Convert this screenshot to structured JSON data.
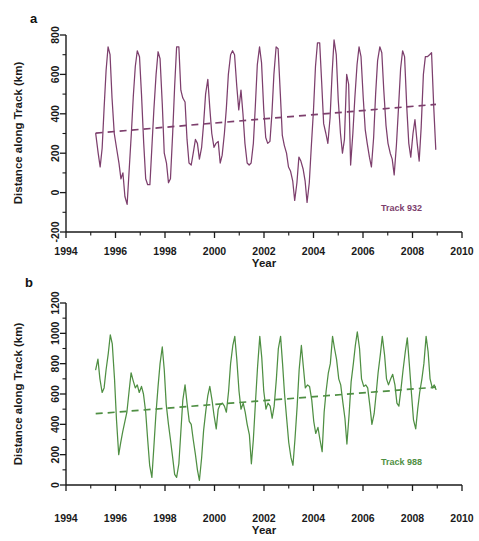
{
  "figure": {
    "background": "#ffffff",
    "panels": [
      {
        "letter": "a",
        "series_label": "Track 932",
        "color": "#7d3f6d",
        "chart_ref": 0
      },
      {
        "letter": "b",
        "series_label": "Track 988",
        "color": "#4f8f43",
        "chart_ref": 1
      }
    ]
  },
  "chart_data": [
    {
      "type": "line",
      "title": "",
      "subtitle": "",
      "xlabel": "Year",
      "ylabel": "Distance along Track (km)",
      "series_label": "Track 932",
      "color": "#7d3f6d",
      "trend_color": "#7d3f6d",
      "trend_style": "dashed",
      "grid": false,
      "legend_position": "inside-bottom-right",
      "xlim": [
        1994,
        2010
      ],
      "ylim": [
        -200,
        800
      ],
      "xticks": [
        1994,
        1996,
        1998,
        2000,
        2002,
        2004,
        2006,
        2008,
        2010
      ],
      "xticks_minor_step": 1,
      "yticks": [
        -200,
        0,
        200,
        400,
        600,
        800
      ],
      "yticks_minor_step": 100,
      "trend_line": {
        "x": [
          1995.2,
          2008.95
        ],
        "y": [
          302,
          448
        ]
      },
      "x": [
        1995.2,
        1995.3,
        1995.38,
        1995.46,
        1995.54,
        1995.62,
        1995.7,
        1995.78,
        1995.86,
        1995.95,
        1996.05,
        1996.14,
        1996.22,
        1996.3,
        1996.38,
        1996.47,
        1996.55,
        1996.64,
        1996.72,
        1996.8,
        1996.88,
        1996.97,
        1997.05,
        1997.14,
        1997.22,
        1997.3,
        1997.39,
        1997.47,
        1997.55,
        1997.64,
        1997.72,
        1997.8,
        1997.89,
        1997.97,
        1998.06,
        1998.14,
        1998.22,
        1998.31,
        1998.39,
        1998.47,
        1998.56,
        1998.64,
        1998.72,
        1998.81,
        1998.89,
        1998.97,
        1999.06,
        1999.14,
        1999.23,
        1999.31,
        1999.39,
        1999.48,
        1999.56,
        1999.64,
        1999.73,
        1999.81,
        1999.89,
        1999.98,
        2000.06,
        2000.15,
        2000.23,
        2000.31,
        2000.4,
        2000.48,
        2000.56,
        2000.65,
        2000.73,
        2000.81,
        2000.9,
        2000.98,
        2001.07,
        2001.15,
        2001.23,
        2001.32,
        2001.4,
        2001.48,
        2001.57,
        2001.65,
        2001.73,
        2001.82,
        2001.9,
        2001.99,
        2002.07,
        2002.15,
        2002.24,
        2002.32,
        2002.4,
        2002.49,
        2002.57,
        2002.66,
        2002.74,
        2002.82,
        2002.91,
        2002.99,
        2003.07,
        2003.16,
        2003.24,
        2003.33,
        2003.41,
        2003.49,
        2003.58,
        2003.66,
        2003.74,
        2003.83,
        2003.91,
        2004.0,
        2004.08,
        2004.16,
        2004.25,
        2004.33,
        2004.41,
        2004.5,
        2004.58,
        2004.67,
        2004.75,
        2004.83,
        2004.92,
        2005.0,
        2005.09,
        2005.17,
        2005.25,
        2005.34,
        2005.42,
        2005.5,
        2005.59,
        2005.67,
        2005.76,
        2005.84,
        2005.92,
        2006.01,
        2006.09,
        2006.17,
        2006.26,
        2006.34,
        2006.43,
        2006.51,
        2006.59,
        2006.68,
        2006.76,
        2006.84,
        2006.93,
        2007.01,
        2007.1,
        2007.18,
        2007.26,
        2007.35,
        2007.43,
        2007.52,
        2007.6,
        2007.68,
        2007.77,
        2007.85,
        2007.93,
        2008.02,
        2008.1,
        2008.19,
        2008.27,
        2008.35,
        2008.44,
        2008.52,
        2008.6,
        2008.69,
        2008.77,
        2008.86,
        2008.94
      ],
      "y": [
        300,
        200,
        130,
        225,
        430,
        620,
        740,
        700,
        480,
        300,
        220,
        150,
        70,
        100,
        -20,
        -60,
        110,
        300,
        490,
        640,
        720,
        690,
        500,
        250,
        70,
        40,
        40,
        230,
        420,
        600,
        715,
        680,
        450,
        200,
        150,
        50,
        70,
        300,
        540,
        740,
        740,
        520,
        480,
        460,
        270,
        150,
        140,
        200,
        270,
        250,
        170,
        230,
        350,
        500,
        575,
        430,
        300,
        230,
        250,
        260,
        150,
        190,
        300,
        430,
        600,
        700,
        720,
        700,
        540,
        420,
        520,
        400,
        250,
        150,
        140,
        150,
        250,
        440,
        650,
        740,
        660,
        420,
        280,
        250,
        260,
        400,
        600,
        740,
        730,
        500,
        290,
        240,
        200,
        130,
        110,
        60,
        -40,
        50,
        180,
        160,
        120,
        60,
        -50,
        50,
        230,
        420,
        640,
        760,
        760,
        560,
        350,
        300,
        250,
        380,
        600,
        775,
        700,
        470,
        300,
        200,
        270,
        600,
        550,
        140,
        300,
        480,
        650,
        740,
        690,
        480,
        320,
        250,
        180,
        130,
        280,
        500,
        670,
        740,
        710,
        520,
        340,
        250,
        200,
        170,
        90,
        240,
        420,
        630,
        720,
        690,
        430,
        250,
        180,
        300,
        370,
        250,
        160,
        330,
        600,
        690,
        690,
        700,
        710,
        430,
        220
      ]
    },
    {
      "type": "line",
      "title": "",
      "subtitle": "",
      "xlabel": "Year",
      "ylabel": "Distance along Track (km)",
      "series_label": "Track 988",
      "color": "#4f8f43",
      "trend_color": "#4f8f43",
      "trend_style": "dashed",
      "grid": false,
      "legend_position": "inside-bottom-right",
      "xlim": [
        1994,
        2010
      ],
      "ylim": [
        0,
        1200
      ],
      "xticks": [
        1994,
        1996,
        1998,
        2000,
        2002,
        2004,
        2006,
        2008,
        2010
      ],
      "xticks_minor_step": 1,
      "yticks": [
        0,
        200,
        400,
        600,
        800,
        1000,
        1200
      ],
      "yticks_minor_step": 100,
      "trend_line": {
        "x": [
          1995.2,
          2008.95
        ],
        "y": [
          470,
          645
        ]
      },
      "x": [
        1995.2,
        1995.29,
        1995.37,
        1995.46,
        1995.54,
        1995.62,
        1995.71,
        1995.79,
        1995.87,
        1995.96,
        1996.04,
        1996.13,
        1996.21,
        1996.29,
        1996.38,
        1996.46,
        1996.55,
        1996.63,
        1996.71,
        1996.8,
        1996.88,
        1996.96,
        1997.05,
        1997.13,
        1997.22,
        1997.3,
        1997.38,
        1997.47,
        1997.55,
        1997.63,
        1997.72,
        1997.8,
        1997.89,
        1997.97,
        1998.05,
        1998.14,
        1998.22,
        1998.31,
        1998.39,
        1998.47,
        1998.56,
        1998.64,
        1998.72,
        1998.81,
        1998.89,
        1998.98,
        1999.06,
        1999.14,
        1999.23,
        1999.31,
        1999.39,
        1999.48,
        1999.56,
        1999.65,
        1999.73,
        1999.81,
        1999.9,
        1999.98,
        2000.07,
        2000.15,
        2000.23,
        2000.32,
        2000.4,
        2000.48,
        2000.57,
        2000.65,
        2000.74,
        2000.82,
        2000.9,
        2000.99,
        2001.07,
        2001.16,
        2001.24,
        2001.32,
        2001.41,
        2001.49,
        2001.57,
        2001.66,
        2001.74,
        2001.83,
        2001.91,
        2001.99,
        2002.08,
        2002.16,
        2002.25,
        2002.33,
        2002.41,
        2002.5,
        2002.58,
        2002.67,
        2002.75,
        2002.83,
        2002.92,
        2003.0,
        2003.09,
        2003.17,
        2003.25,
        2003.34,
        2003.42,
        2003.51,
        2003.59,
        2003.67,
        2003.76,
        2003.84,
        2003.93,
        2004.01,
        2004.09,
        2004.18,
        2004.26,
        2004.35,
        2004.43,
        2004.51,
        2004.6,
        2004.68,
        2004.77,
        2004.85,
        2004.93,
        2005.02,
        2005.1,
        2005.19,
        2005.27,
        2005.35,
        2005.44,
        2005.52,
        2005.61,
        2005.69,
        2005.77,
        2005.86,
        2005.94,
        2006.03,
        2006.11,
        2006.19,
        2006.28,
        2006.36,
        2006.45,
        2006.53,
        2006.61,
        2006.7,
        2006.78,
        2006.87,
        2006.95,
        2007.03,
        2007.12,
        2007.2,
        2007.29,
        2007.37,
        2007.45,
        2007.54,
        2007.62,
        2007.71,
        2007.79,
        2007.87,
        2007.96,
        2008.04,
        2008.13,
        2008.21,
        2008.29,
        2008.38,
        2008.46,
        2008.55,
        2008.63,
        2008.71,
        2008.8,
        2008.88,
        2008.95
      ],
      "y": [
        760,
        830,
        700,
        610,
        640,
        760,
        870,
        990,
        930,
        700,
        430,
        200,
        280,
        350,
        420,
        480,
        620,
        740,
        690,
        640,
        660,
        610,
        650,
        600,
        480,
        300,
        130,
        50,
        250,
        460,
        650,
        800,
        910,
        760,
        530,
        400,
        300,
        180,
        70,
        50,
        140,
        350,
        560,
        660,
        540,
        420,
        400,
        300,
        200,
        100,
        30,
        180,
        360,
        490,
        590,
        650,
        560,
        460,
        370,
        500,
        530,
        540,
        520,
        480,
        620,
        800,
        920,
        980,
        830,
        620,
        500,
        540,
        480,
        400,
        330,
        140,
        300,
        560,
        780,
        980,
        840,
        620,
        500,
        540,
        520,
        440,
        520,
        700,
        900,
        980,
        800,
        600,
        430,
        280,
        180,
        130,
        300,
        520,
        760,
        920,
        780,
        640,
        660,
        650,
        560,
        420,
        340,
        380,
        300,
        220,
        480,
        620,
        740,
        800,
        980,
        900,
        830,
        700,
        660,
        540,
        440,
        270,
        470,
        680,
        800,
        920,
        1010,
        900,
        700,
        650,
        660,
        640,
        520,
        400,
        470,
        600,
        740,
        860,
        980,
        860,
        700,
        660,
        700,
        730,
        660,
        540,
        520,
        640,
        760,
        880,
        970,
        800,
        600,
        430,
        370,
        500,
        610,
        700,
        800,
        980,
        880,
        700,
        640,
        660,
        630
      ]
    }
  ]
}
